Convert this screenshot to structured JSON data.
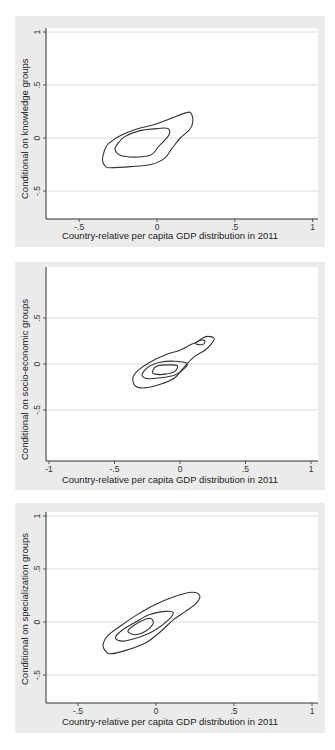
{
  "chart_data": [
    {
      "type": "contour",
      "title": "",
      "xlabel": "Country-relative per capita GDP distribution in 2011",
      "ylabel": "Conditional on knowledge groups",
      "xticks": [
        -0.5,
        0,
        0.5,
        1
      ],
      "xtick_labels": [
        "-.5",
        "0",
        ".5",
        "1"
      ],
      "yticks": [
        -0.5,
        0,
        0.5,
        1
      ],
      "ytick_labels": [
        "-.5",
        "0",
        ".5",
        "1"
      ],
      "xlim": [
        -0.7,
        1.02
      ],
      "ylim": [
        -0.76,
        1.02
      ],
      "grid": "horizontal",
      "contours": [
        {
          "level": "outer",
          "points": [
            [
              -0.33,
              -0.27
            ],
            [
              -0.35,
              -0.21
            ],
            [
              -0.33,
              -0.09
            ],
            [
              -0.3,
              -0.04
            ],
            [
              -0.24,
              0.02
            ],
            [
              -0.14,
              0.08
            ],
            [
              -0.01,
              0.13
            ],
            [
              0.08,
              0.18
            ],
            [
              0.19,
              0.24
            ],
            [
              0.22,
              0.23
            ],
            [
              0.23,
              0.15
            ],
            [
              0.21,
              0.08
            ],
            [
              0.15,
              0.0
            ],
            [
              0.1,
              -0.09
            ],
            [
              0.05,
              -0.19
            ],
            [
              -0.04,
              -0.25
            ],
            [
              -0.17,
              -0.27
            ],
            [
              -0.3,
              -0.28
            ]
          ]
        },
        {
          "level": "inner",
          "points": [
            [
              -0.26,
              -0.07
            ],
            [
              -0.21,
              0.01
            ],
            [
              -0.11,
              0.07
            ],
            [
              0.01,
              0.09
            ],
            [
              0.07,
              0.09
            ],
            [
              0.08,
              0.04
            ],
            [
              0.05,
              -0.02
            ],
            [
              0.01,
              -0.08
            ],
            [
              -0.04,
              -0.16
            ],
            [
              -0.15,
              -0.18
            ],
            [
              -0.24,
              -0.16
            ],
            [
              -0.27,
              -0.11
            ]
          ]
        }
      ]
    },
    {
      "type": "contour",
      "title": "",
      "xlabel": "Country-relative per capita GDP distribution in 2011",
      "ylabel": "Conditional on socio-economic groups",
      "xticks": [
        -1,
        -0.5,
        0,
        0.5,
        1
      ],
      "xtick_labels": [
        "-1",
        "-.5",
        "0",
        ".5",
        "1"
      ],
      "yticks": [
        -0.5,
        0,
        0.5
      ],
      "ytick_labels": [
        "-.5",
        "0",
        ".5"
      ],
      "xlim": [
        -1.03,
        1.03
      ],
      "ylim": [
        -1.05,
        1.05
      ],
      "grid": "horizontal",
      "contours": [
        {
          "level": "outer",
          "points": [
            [
              -0.34,
              -0.24
            ],
            [
              -0.36,
              -0.15
            ],
            [
              -0.32,
              -0.07
            ],
            [
              -0.23,
              0.02
            ],
            [
              -0.11,
              0.1
            ],
            [
              0.0,
              0.15
            ],
            [
              0.08,
              0.21
            ],
            [
              0.13,
              0.24
            ],
            [
              0.17,
              0.28
            ],
            [
              0.21,
              0.3
            ],
            [
              0.26,
              0.28
            ],
            [
              0.24,
              0.22
            ],
            [
              0.19,
              0.15
            ],
            [
              0.11,
              0.08
            ],
            [
              0.04,
              -0.02
            ],
            [
              -0.04,
              -0.15
            ],
            [
              -0.15,
              -0.22
            ],
            [
              -0.27,
              -0.26
            ]
          ]
        },
        {
          "level": "middle",
          "points": [
            [
              -0.29,
              -0.12
            ],
            [
              -0.24,
              -0.03
            ],
            [
              -0.15,
              0.02
            ],
            [
              -0.04,
              0.03
            ],
            [
              0.05,
              0.01
            ],
            [
              0.04,
              -0.04
            ],
            [
              -0.04,
              -0.12
            ],
            [
              -0.15,
              -0.15
            ],
            [
              -0.24,
              -0.16
            ]
          ]
        },
        {
          "level": "inner",
          "points": [
            [
              -0.21,
              -0.08
            ],
            [
              -0.17,
              -0.02
            ],
            [
              -0.08,
              -0.01
            ],
            [
              -0.02,
              -0.02
            ],
            [
              -0.04,
              -0.08
            ],
            [
              -0.11,
              -0.11
            ],
            [
              -0.19,
              -0.11
            ]
          ]
        },
        {
          "level": "inner-island",
          "points": [
            [
              0.12,
              0.22
            ],
            [
              0.14,
              0.25
            ],
            [
              0.18,
              0.26
            ],
            [
              0.19,
              0.24
            ],
            [
              0.17,
              0.21
            ]
          ]
        }
      ]
    },
    {
      "type": "contour",
      "title": "",
      "xlabel": "Country-relative per capita GDP distribution in 2011",
      "ylabel": "Conditional on specialization groups",
      "xticks": [
        -0.5,
        0,
        0.5,
        1
      ],
      "xtick_labels": [
        "-.5",
        "0",
        ".5",
        "1"
      ],
      "yticks": [
        -0.5,
        0,
        0.5,
        1
      ],
      "ytick_labels": [
        "-.5",
        "0",
        ".5",
        "1"
      ],
      "xlim": [
        -0.71,
        1.02
      ],
      "ylim": [
        -0.76,
        1.04
      ],
      "grid": "horizontal",
      "contours": [
        {
          "level": "outer",
          "points": [
            [
              -0.32,
              -0.28
            ],
            [
              -0.34,
              -0.22
            ],
            [
              -0.31,
              -0.13
            ],
            [
              -0.23,
              -0.04
            ],
            [
              -0.13,
              0.06
            ],
            [
              -0.01,
              0.16
            ],
            [
              0.12,
              0.24
            ],
            [
              0.23,
              0.28
            ],
            [
              0.28,
              0.25
            ],
            [
              0.26,
              0.18
            ],
            [
              0.19,
              0.1
            ],
            [
              0.11,
              0.02
            ],
            [
              0.03,
              -0.09
            ],
            [
              -0.07,
              -0.2
            ],
            [
              -0.2,
              -0.27
            ],
            [
              -0.29,
              -0.3
            ]
          ]
        },
        {
          "level": "middle",
          "points": [
            [
              -0.26,
              -0.15
            ],
            [
              -0.22,
              -0.08
            ],
            [
              -0.13,
              -0.0
            ],
            [
              -0.04,
              0.07
            ],
            [
              0.06,
              0.1
            ],
            [
              0.11,
              0.09
            ],
            [
              0.08,
              0.02
            ],
            [
              -0.01,
              -0.08
            ],
            [
              -0.1,
              -0.14
            ],
            [
              -0.21,
              -0.18
            ]
          ]
        },
        {
          "level": "inner",
          "points": [
            [
              -0.18,
              -0.09
            ],
            [
              -0.15,
              -0.04
            ],
            [
              -0.08,
              0.02
            ],
            [
              -0.03,
              0.03
            ],
            [
              -0.02,
              -0.02
            ],
            [
              -0.07,
              -0.09
            ],
            [
              -0.13,
              -0.12
            ]
          ]
        }
      ]
    }
  ],
  "panels": [
    {
      "ylabel": "Conditional on knowledge groups",
      "xlabel": "Country-relative per capita GDP distribution in 2011"
    },
    {
      "ylabel": "Conditional on socio-economic groups",
      "xlabel": "Country-relative per capita GDP distribution in 2011"
    },
    {
      "ylabel": "Conditional on specialization groups",
      "xlabel": "Country-relative per capita GDP distribution in 2011"
    }
  ],
  "colors": {
    "panel_bg": "#ebebeb",
    "plot_bg": "#ffffff",
    "grid": "#dcdcdc",
    "axis": "#333333",
    "contour": "#333333"
  }
}
